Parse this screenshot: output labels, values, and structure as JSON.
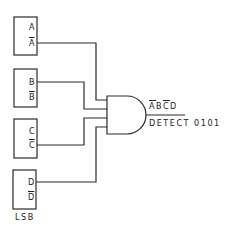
{
  "diagram": {
    "type": "logic-circuit",
    "colors": {
      "line": "#2a2a2a",
      "background": "#ffffff"
    },
    "flipflops": [
      {
        "id": "A",
        "q": "A",
        "q_bar": "A",
        "connected_output": "q_bar"
      },
      {
        "id": "B",
        "q": "B",
        "q_bar": "B",
        "connected_output": "q"
      },
      {
        "id": "C",
        "q": "C",
        "q_bar": "C",
        "connected_output": "q_bar"
      },
      {
        "id": "D",
        "q": "D",
        "q_bar": "D",
        "connected_output": "q",
        "note": "LSB"
      }
    ],
    "gate": {
      "type": "AND",
      "inputs": 4
    },
    "output_label": {
      "expr": [
        "A",
        "B",
        "C",
        "D"
      ],
      "expr_overlines": [
        true,
        false,
        true,
        false
      ],
      "name": "DETECT 0101"
    },
    "lsb_label": "LSB"
  }
}
